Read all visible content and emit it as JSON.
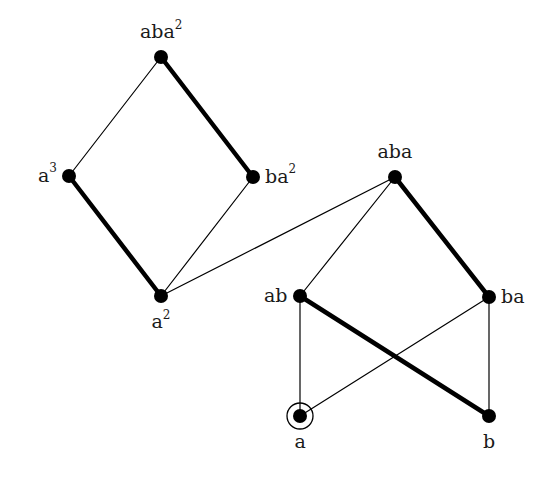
{
  "diagram": {
    "type": "hasse-diagram",
    "colors": {
      "line": "#000000",
      "node": "#000000",
      "text": "#1a1a1a"
    },
    "nodes": [
      {
        "id": "aba2",
        "base": "aba",
        "exp": "2",
        "x": 161,
        "y": 57,
        "label_pos": "above"
      },
      {
        "id": "a3",
        "base": "a",
        "exp": "3",
        "x": 69,
        "y": 176,
        "label_pos": "left"
      },
      {
        "id": "ba2",
        "base": "ba",
        "exp": "2",
        "x": 253,
        "y": 177,
        "label_pos": "right"
      },
      {
        "id": "a2",
        "base": "a",
        "exp": "2",
        "x": 161,
        "y": 296,
        "label_pos": "below"
      },
      {
        "id": "aba",
        "base": "aba",
        "exp": "",
        "x": 395,
        "y": 177,
        "label_pos": "above"
      },
      {
        "id": "ab",
        "base": "ab",
        "exp": "",
        "x": 300,
        "y": 296,
        "label_pos": "left"
      },
      {
        "id": "ba",
        "base": "ba",
        "exp": "",
        "x": 489,
        "y": 297,
        "label_pos": "right"
      },
      {
        "id": "a",
        "base": "a",
        "exp": "",
        "x": 300,
        "y": 416,
        "label_pos": "below",
        "circled": true
      },
      {
        "id": "b",
        "base": "b",
        "exp": "",
        "x": 489,
        "y": 416,
        "label_pos": "below"
      }
    ],
    "edges": [
      {
        "from": "aba2",
        "to": "a3",
        "weight": "thin"
      },
      {
        "from": "aba2",
        "to": "ba2",
        "weight": "thick"
      },
      {
        "from": "a3",
        "to": "a2",
        "weight": "thick"
      },
      {
        "from": "ba2",
        "to": "a2",
        "weight": "thin"
      },
      {
        "from": "a2",
        "to": "aba",
        "weight": "thin"
      },
      {
        "from": "aba",
        "to": "ab",
        "weight": "thin"
      },
      {
        "from": "aba",
        "to": "ba",
        "weight": "thick"
      },
      {
        "from": "ab",
        "to": "a",
        "weight": "thin"
      },
      {
        "from": "ab",
        "to": "b",
        "weight": "thick"
      },
      {
        "from": "ba",
        "to": "a",
        "weight": "thin"
      },
      {
        "from": "ba",
        "to": "b",
        "weight": "thin"
      }
    ]
  }
}
